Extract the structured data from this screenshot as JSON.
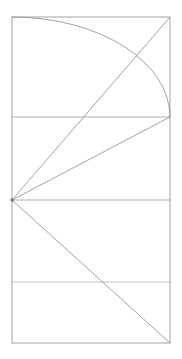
{
  "figure": {
    "background_color": "#ffffff",
    "stroke_color": "#8a8a8a",
    "frame_stroke_color": "#9a9a9a",
    "arc_stroke_color": "#8a8a8a",
    "stroke_width": 0.8,
    "canvas": {
      "width": 182,
      "height": 359
    }
  },
  "chart_data": {
    "type": "line",
    "xlabel": "",
    "ylabel": "",
    "xlim": [
      0,
      182
    ],
    "ylim": [
      359,
      0
    ],
    "grid": false,
    "legend": "none",
    "frame": {
      "name": "outer-rectangle",
      "x1": 12,
      "y1": 17,
      "x2": 170,
      "y2": 343
    },
    "dividers": [
      {
        "name": "divider-upper",
        "x1": 12,
        "y1": 117,
        "x2": 170,
        "y2": 117
      },
      {
        "name": "divider-middle",
        "x1": 12,
        "y1": 200,
        "x2": 170,
        "y2": 200
      },
      {
        "name": "divider-lower",
        "x1": 12,
        "y1": 282,
        "x2": 170,
        "y2": 282
      }
    ],
    "vertex": {
      "name": "pencil-point",
      "x": 12,
      "y": 200
    },
    "rays": [
      {
        "name": "ray-to-top-right",
        "x1": 12,
        "y1": 200,
        "x2": 170,
        "y2": 17
      },
      {
        "name": "ray-to-right-upper",
        "x1": 12,
        "y1": 200,
        "x2": 170,
        "y2": 117
      },
      {
        "name": "ray-to-bottom-right",
        "x1": 12,
        "y1": 200,
        "x2": 170,
        "y2": 343
      }
    ],
    "arc": {
      "name": "quarter-arc",
      "start": {
        "x": 12,
        "y": 17
      },
      "end": {
        "x": 170,
        "y": 117
      },
      "center": {
        "x": 12,
        "y": 117
      },
      "rx": 158,
      "ry": 100,
      "sampled_points": [
        {
          "x": 12,
          "y": 17
        },
        {
          "x": 70,
          "y": 23
        },
        {
          "x": 85,
          "y": 28
        },
        {
          "x": 125,
          "y": 44
        },
        {
          "x": 150,
          "y": 72
        },
        {
          "x": 170,
          "y": 117
        }
      ]
    },
    "intersections": [
      {
        "name": "arc-crosses-top-right-ray",
        "x": 131,
        "y": 66
      }
    ]
  }
}
